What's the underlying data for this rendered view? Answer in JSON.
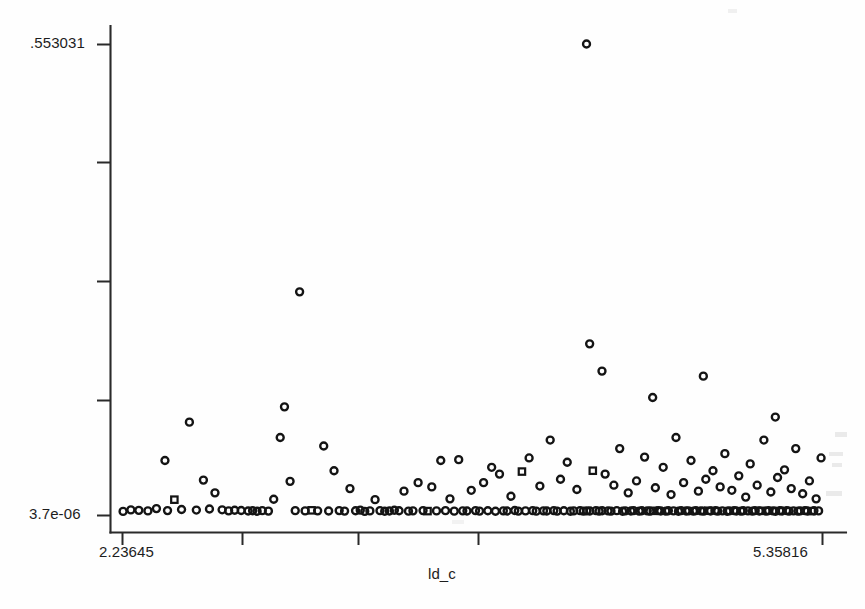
{
  "chart_data": {
    "type": "scatter",
    "title": "",
    "xlabel": "ld_c",
    "ylabel": "",
    "xlim": [
      2.23645,
      5.35816
    ],
    "ylim": [
      3.7e-06,
      0.553031
    ],
    "grid": false,
    "legend": null,
    "x_tick_labels": [
      "2.23645",
      "5.35816"
    ],
    "y_tick_labels": [
      ".553031",
      "3.7e-06"
    ],
    "x_tick_count": 5,
    "y_tick_count": 5,
    "marker": "open-circle",
    "n_points": 287,
    "points": [
      [
        2.2413,
        0.0042
      ],
      [
        2.276,
        0.006
      ],
      [
        2.3115,
        0.0055
      ],
      [
        2.352,
        0.0048
      ],
      [
        2.39,
        0.0075
      ],
      [
        2.428,
        0.064
      ],
      [
        2.4395,
        0.0052
      ],
      [
        2.47,
        0.018
      ],
      [
        2.502,
        0.0065
      ],
      [
        2.537,
        0.109
      ],
      [
        2.568,
        0.0058
      ],
      [
        2.5995,
        0.041
      ],
      [
        2.6265,
        0.007
      ],
      [
        2.651,
        0.026
      ],
      [
        2.683,
        0.0061
      ],
      [
        2.712,
        0.0049
      ],
      [
        2.739,
        0.0056
      ],
      [
        2.768,
        0.0053
      ],
      [
        2.799,
        0.0047
      ],
      [
        2.819,
        0.005
      ],
      [
        2.839,
        0.0044
      ],
      [
        2.862,
        0.0051
      ],
      [
        2.8895,
        0.0046
      ],
      [
        2.913,
        0.0185
      ],
      [
        2.942,
        0.091
      ],
      [
        2.961,
        0.127
      ],
      [
        2.986,
        0.0395
      ],
      [
        3.009,
        0.0051
      ],
      [
        3.0285,
        0.262
      ],
      [
        3.053,
        0.0048
      ],
      [
        3.082,
        0.0055
      ],
      [
        3.109,
        0.0049
      ],
      [
        3.136,
        0.081
      ],
      [
        3.158,
        0.0047
      ],
      [
        3.182,
        0.052
      ],
      [
        3.205,
        0.0052
      ],
      [
        3.229,
        0.0046
      ],
      [
        3.253,
        0.031
      ],
      [
        3.278,
        0.005
      ],
      [
        3.299,
        0.0057
      ],
      [
        3.319,
        0.0043
      ],
      [
        3.342,
        0.0048
      ],
      [
        3.365,
        0.018
      ],
      [
        3.387,
        0.0051
      ],
      [
        3.408,
        0.0044
      ],
      [
        3.429,
        0.0047
      ],
      [
        3.451,
        0.0056
      ],
      [
        3.472,
        0.005
      ],
      [
        3.494,
        0.028
      ],
      [
        3.514,
        0.0045
      ],
      [
        3.534,
        0.0049
      ],
      [
        3.557,
        0.038
      ],
      [
        3.579,
        0.0052
      ],
      [
        3.599,
        0.0046
      ],
      [
        3.618,
        0.033
      ],
      [
        3.639,
        0.0048
      ],
      [
        3.658,
        0.064
      ],
      [
        3.679,
        0.0051
      ],
      [
        3.699,
        0.019
      ],
      [
        3.718,
        0.0045
      ],
      [
        3.738,
        0.065
      ],
      [
        3.756,
        0.0049
      ],
      [
        3.775,
        0.0047
      ],
      [
        3.794,
        0.029
      ],
      [
        3.813,
        0.0052
      ],
      [
        3.831,
        0.0046
      ],
      [
        3.849,
        0.038
      ],
      [
        3.868,
        0.005
      ],
      [
        3.885,
        0.056
      ],
      [
        3.902,
        0.0044
      ],
      [
        3.92,
        0.048
      ],
      [
        3.937,
        0.0049
      ],
      [
        3.954,
        0.0047
      ],
      [
        3.971,
        0.022
      ],
      [
        3.988,
        0.0053
      ],
      [
        4.004,
        0.0046
      ],
      [
        4.02,
        0.051
      ],
      [
        4.036,
        0.0048
      ],
      [
        4.052,
        0.067
      ],
      [
        4.068,
        0.0051
      ],
      [
        4.084,
        0.0045
      ],
      [
        4.1,
        0.034
      ],
      [
        4.116,
        0.0049
      ],
      [
        4.131,
        0.0047
      ],
      [
        4.146,
        0.088
      ],
      [
        4.162,
        0.0052
      ],
      [
        4.177,
        0.0046
      ],
      [
        4.192,
        0.042
      ],
      [
        4.207,
        0.005
      ],
      [
        4.222,
        0.062
      ],
      [
        4.236,
        0.0044
      ],
      [
        4.251,
        0.0048
      ],
      [
        4.265,
        0.03
      ],
      [
        4.279,
        0.0051
      ],
      [
        4.294,
        0.0046
      ],
      [
        4.308,
        0.553
      ],
      [
        4.309,
        0.0049
      ],
      [
        4.322,
        0.201
      ],
      [
        4.323,
        0.0047
      ],
      [
        4.336,
        0.052
      ],
      [
        4.35,
        0.0052
      ],
      [
        4.364,
        0.0045
      ],
      [
        4.377,
        0.169
      ],
      [
        4.378,
        0.005
      ],
      [
        4.391,
        0.048
      ],
      [
        4.404,
        0.0048
      ],
      [
        4.417,
        0.0046
      ],
      [
        4.43,
        0.035
      ],
      [
        4.443,
        0.0051
      ],
      [
        4.456,
        0.078
      ],
      [
        4.469,
        0.0044
      ],
      [
        4.481,
        0.0049
      ],
      [
        4.494,
        0.026
      ],
      [
        4.506,
        0.0047
      ],
      [
        4.518,
        0.0052
      ],
      [
        4.531,
        0.04
      ],
      [
        4.543,
        0.0046
      ],
      [
        4.555,
        0.005
      ],
      [
        4.567,
        0.068
      ],
      [
        4.579,
        0.0048
      ],
      [
        4.591,
        0.0045
      ],
      [
        4.603,
        0.138
      ],
      [
        4.604,
        0.0049
      ],
      [
        4.615,
        0.032
      ],
      [
        4.627,
        0.0051
      ],
      [
        4.639,
        0.0047
      ],
      [
        4.65,
        0.056
      ],
      [
        4.662,
        0.0046
      ],
      [
        4.673,
        0.005
      ],
      [
        4.685,
        0.024
      ],
      [
        4.696,
        0.0048
      ],
      [
        4.707,
        0.091
      ],
      [
        4.718,
        0.0044
      ],
      [
        4.73,
        0.0052
      ],
      [
        4.741,
        0.038
      ],
      [
        4.752,
        0.0047
      ],
      [
        4.763,
        0.0049
      ],
      [
        4.774,
        0.064
      ],
      [
        4.785,
        0.0046
      ],
      [
        4.796,
        0.0051
      ],
      [
        4.807,
        0.028
      ],
      [
        4.818,
        0.0048
      ],
      [
        4.829,
        0.163
      ],
      [
        4.83,
        0.0045
      ],
      [
        4.84,
        0.042
      ],
      [
        4.851,
        0.005
      ],
      [
        4.861,
        0.0047
      ],
      [
        4.872,
        0.052
      ],
      [
        4.883,
        0.0052
      ],
      [
        4.893,
        0.0046
      ],
      [
        4.904,
        0.033
      ],
      [
        4.914,
        0.0049
      ],
      [
        4.925,
        0.072
      ],
      [
        4.935,
        0.0044
      ],
      [
        4.945,
        0.0048
      ],
      [
        4.956,
        0.029
      ],
      [
        4.966,
        0.0051
      ],
      [
        4.976,
        0.0047
      ],
      [
        4.987,
        0.046
      ],
      [
        4.997,
        0.0046
      ],
      [
        5.007,
        0.005
      ],
      [
        5.018,
        0.021
      ],
      [
        5.028,
        0.0048
      ],
      [
        5.038,
        0.06
      ],
      [
        5.048,
        0.0045
      ],
      [
        5.059,
        0.0052
      ],
      [
        5.069,
        0.035
      ],
      [
        5.079,
        0.0047
      ],
      [
        5.089,
        0.0049
      ],
      [
        5.099,
        0.088
      ],
      [
        5.11,
        0.0046
      ],
      [
        5.12,
        0.0051
      ],
      [
        5.13,
        0.027
      ],
      [
        5.14,
        0.0048
      ],
      [
        5.15,
        0.115
      ],
      [
        5.151,
        0.0044
      ],
      [
        5.16,
        0.044
      ],
      [
        5.17,
        0.005
      ],
      [
        5.18,
        0.0047
      ],
      [
        5.191,
        0.053
      ],
      [
        5.201,
        0.0052
      ],
      [
        5.211,
        0.0046
      ],
      [
        5.221,
        0.031
      ],
      [
        5.231,
        0.0049
      ],
      [
        5.241,
        0.078
      ],
      [
        5.251,
        0.0045
      ],
      [
        5.261,
        0.0048
      ],
      [
        5.272,
        0.025
      ],
      [
        5.282,
        0.0051
      ],
      [
        5.292,
        0.0047
      ],
      [
        5.302,
        0.04
      ],
      [
        5.312,
        0.0046
      ],
      [
        5.322,
        0.005
      ],
      [
        5.332,
        0.019
      ],
      [
        5.343,
        0.0048
      ],
      [
        5.354,
        0.067
      ]
    ]
  },
  "axes": {
    "y_top_label": ".553031",
    "y_bottom_label": "3.7e-06",
    "x_left_label": "2.23645",
    "x_right_label": "5.35816",
    "x_axis_title": "ld_c"
  },
  "colors": {
    "marker_stroke": "#141414",
    "axis": "#2a2a2a",
    "background": "#fefefe",
    "text": "#1d1d1d"
  }
}
